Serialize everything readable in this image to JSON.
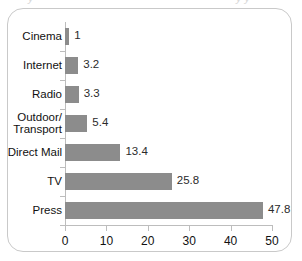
{
  "frame": {
    "border_color": "#c9c9c9",
    "background": "#ffffff"
  },
  "top_cutoff": {
    "left_fragment": "y",
    "right_fragment": "y y"
  },
  "chart_data": {
    "type": "bar",
    "orientation": "horizontal",
    "title": "",
    "subtitle": "",
    "xlabel": "",
    "ylabel": "",
    "categories": [
      "Cinema",
      "Internet",
      "Radio",
      "Outdoor/\nTransport",
      "Direct Mail",
      "TV",
      "Press"
    ],
    "values": [
      1,
      3.2,
      3.3,
      5.4,
      13.4,
      25.8,
      47.8
    ],
    "value_labels": [
      "1",
      "3.2",
      "3.3",
      "5.4",
      "13.4",
      "25.8",
      "47.8"
    ],
    "xlim": [
      0,
      50
    ],
    "xticks": [
      0,
      10,
      20,
      30,
      40,
      50
    ],
    "xtick_labels": [
      "0",
      "10",
      "20",
      "30",
      "40",
      "50"
    ],
    "grid": false,
    "legend": null,
    "bar_color": "#8c8c8c",
    "axis_color": "#bdbdbd",
    "label_color": "#111111"
  }
}
